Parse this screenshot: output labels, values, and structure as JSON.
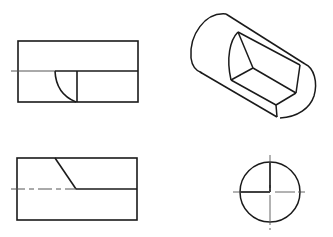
{
  "diagram": {
    "type": "engineering-three-view-drawing",
    "line_color": "#1a1a1a",
    "centerline_color": "#444444",
    "background": "#ffffff",
    "views": [
      {
        "name": "front-view",
        "description": "Rectangle with horizontal center line and quarter-arc cutout"
      },
      {
        "name": "isometric-view",
        "description": "Cylinder with a stepped slot cut"
      },
      {
        "name": "top-view",
        "description": "Rectangle with diagonal cut and dashed center line"
      },
      {
        "name": "side-view",
        "description": "Circle with crossed center lines and quarter sector"
      }
    ]
  }
}
